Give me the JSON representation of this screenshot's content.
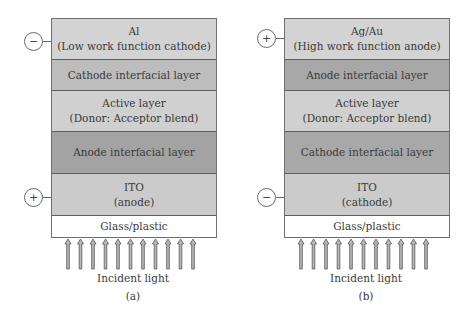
{
  "figure": {
    "panels": [
      {
        "id": "a",
        "label": "(a)",
        "top_terminal": "−",
        "bottom_terminal": "+",
        "layers": [
          {
            "line1": "Al",
            "line2": "(Low work function cathode)",
            "color": "#d3d3d3"
          },
          {
            "line1": "Cathode interfacial layer",
            "color": "#bdbdbd"
          },
          {
            "line1": "Active layer",
            "line2": "(Donor: Acceptor blend)",
            "color": "#d0d0d0"
          },
          {
            "line1": "Anode interfacial layer",
            "color": "#a3a3a3"
          },
          {
            "line1": "ITO",
            "line2": "(anode)",
            "color": "#cbcbcb"
          },
          {
            "line1": "Glass/plastic",
            "color": "#ffffff"
          }
        ],
        "light_label": "Incident light"
      },
      {
        "id": "b",
        "label": "(b)",
        "top_terminal": "+",
        "bottom_terminal": "−",
        "layers": [
          {
            "line1": "Ag/Au",
            "line2": "(High work function anode)",
            "color": "#d3d3d3"
          },
          {
            "line1": "Anode interfacial layer",
            "color": "#a8a8a8"
          },
          {
            "line1": "Active layer",
            "line2": "(Donor: Acceptor blend)",
            "color": "#d0d0d0"
          },
          {
            "line1": "Cathode interfacial layer",
            "color": "#a8a8a8"
          },
          {
            "line1": "ITO",
            "line2": "(cathode)",
            "color": "#cbcbcb"
          },
          {
            "line1": "Glass/plastic",
            "color": "#ffffff"
          }
        ],
        "light_label": "Incident light"
      }
    ],
    "arrow_count": 11
  }
}
